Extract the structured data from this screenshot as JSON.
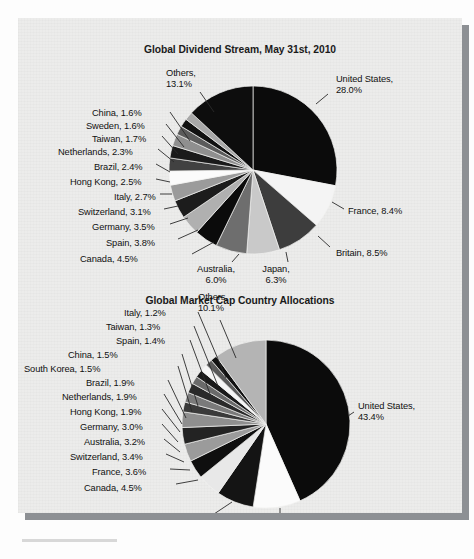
{
  "document": {
    "page_background": "#ececeb",
    "shadow_color": "#8d9094"
  },
  "chart_data": [
    {
      "type": "pie",
      "title": "Global Dividend Stream, May 31st, 2010",
      "xlabel": "",
      "ylabel": "",
      "legend_position": "callout-labels",
      "start_angle_deg": 0,
      "direction": "clockwise",
      "categories": [
        "United States",
        "France",
        "Britain",
        "Japan",
        "Australia",
        "Canada",
        "Spain",
        "Germany",
        "Switzerland",
        "Italy",
        "Hong Kong",
        "Brazil",
        "Netherlands",
        "Taiwan",
        "Sweden",
        "China",
        "Others"
      ],
      "values": [
        28.0,
        8.4,
        8.5,
        6.3,
        6.0,
        4.5,
        3.8,
        3.5,
        3.1,
        2.7,
        2.5,
        2.4,
        2.3,
        1.7,
        1.6,
        1.6,
        13.1
      ],
      "colors": [
        "#0b0b0b",
        "#f4f4f4",
        "#3d3d3d",
        "#c9c9c9",
        "#6e6e6e",
        "#0b0b0b",
        "#b0b0b0",
        "#1c1c1c",
        "#9b9b9b",
        "#fbfbfb",
        "#414141",
        "#1a1a1a",
        "#8f8f8f",
        "#5b5b5b",
        "#111111",
        "#a8a8a8",
        "#0d0d0d"
      ],
      "labels": [
        {
          "name": "United States",
          "value": "28.0%",
          "text_line1": "United States,",
          "text_line2": "28.0%"
        },
        {
          "name": "France",
          "value": "8.4%",
          "text_line1": "France, 8.4%",
          "text_line2": ""
        },
        {
          "name": "Britain",
          "value": "8.5%",
          "text_line1": "Britain, 8.5%",
          "text_line2": ""
        },
        {
          "name": "Japan",
          "value": "6.3%",
          "text_line1": "Japan,",
          "text_line2": "6.3%"
        },
        {
          "name": "Australia",
          "value": "6.0%",
          "text_line1": "Australia,",
          "text_line2": "6.0%"
        },
        {
          "name": "Canada",
          "value": "4.5%",
          "text_line1": "Canada, 4.5%",
          "text_line2": ""
        },
        {
          "name": "Spain",
          "value": "3.8%",
          "text_line1": "Spain, 3.8%",
          "text_line2": ""
        },
        {
          "name": "Germany",
          "value": "3.5%",
          "text_line1": "Germany, 3.5%",
          "text_line2": ""
        },
        {
          "name": "Switzerland",
          "value": "3.1%",
          "text_line1": "Switzerland, 3.1%",
          "text_line2": ""
        },
        {
          "name": "Italy",
          "value": "2.7%",
          "text_line1": "Italy, 2.7%",
          "text_line2": ""
        },
        {
          "name": "Hong Kong",
          "value": "2.5%",
          "text_line1": "Hong Kong, 2.5%",
          "text_line2": ""
        },
        {
          "name": "Brazil",
          "value": "2.4%",
          "text_line1": "Brazil, 2.4%",
          "text_line2": ""
        },
        {
          "name": "Netherlands",
          "value": "2.3%",
          "text_line1": "Netherlands, 2.3%",
          "text_line2": ""
        },
        {
          "name": "Taiwan",
          "value": "1.7%",
          "text_line1": "Taiwan, 1.7%",
          "text_line2": ""
        },
        {
          "name": "Sweden",
          "value": "1.6%",
          "text_line1": "Sweden, 1.6%",
          "text_line2": ""
        },
        {
          "name": "China",
          "value": "1.6%",
          "text_line1": "China, 1.6%",
          "text_line2": ""
        },
        {
          "name": "Others",
          "value": "13.1%",
          "text_line1": "Others,",
          "text_line2": "13.1%"
        }
      ]
    },
    {
      "type": "pie",
      "title": "Global Market Cap Country Allocations",
      "xlabel": "",
      "ylabel": "",
      "legend_position": "callout-labels",
      "start_angle_deg": 0,
      "direction": "clockwise",
      "categories": [
        "United States",
        "Japan",
        "Britain",
        "Canada",
        "France",
        "Switzerland",
        "Australia",
        "Germany",
        "Hong Kong",
        "Netherlands",
        "Brazil",
        "South Korea",
        "China",
        "Spain",
        "Taiwan",
        "Italy",
        "Others"
      ],
      "values": [
        43.4,
        9.1,
        7.2,
        4.5,
        3.6,
        3.4,
        3.2,
        3.0,
        1.9,
        1.9,
        1.9,
        1.5,
        1.5,
        1.4,
        1.3,
        1.2,
        10.1
      ],
      "colors": [
        "#0b0b0b",
        "#fbfbfb",
        "#141414",
        "#e8e8e8",
        "#0f0f0f",
        "#9b9b9b",
        "#232323",
        "#8f8f8f",
        "#3a3a3a",
        "#7a7a7a",
        "#2a2a2a",
        "#6a6a6a",
        "#1a1a1a",
        "#f6f6f6",
        "#5a5a5a",
        "#111111",
        "#b4b4b4"
      ],
      "labels": [
        {
          "name": "United States",
          "value": "43.4%",
          "text_line1": "United States,",
          "text_line2": "43.4%"
        },
        {
          "name": "Japan",
          "value": "9.1%",
          "text_line1": "Japan,",
          "text_line2": "9.1%"
        },
        {
          "name": "Britain",
          "value": "7.2%",
          "text_line1": "Britain,",
          "text_line2": "7.2%"
        },
        {
          "name": "Canada",
          "value": "4.5%",
          "text_line1": "Canada, 4.5%",
          "text_line2": ""
        },
        {
          "name": "France",
          "value": "3.6%",
          "text_line1": "France, 3.6%",
          "text_line2": ""
        },
        {
          "name": "Switzerland",
          "value": "3.4%",
          "text_line1": "Switzerland, 3.4%",
          "text_line2": ""
        },
        {
          "name": "Australia",
          "value": "3.2%",
          "text_line1": "Australia, 3.2%",
          "text_line2": ""
        },
        {
          "name": "Germany",
          "value": "3.0%",
          "text_line1": "Germany, 3.0%",
          "text_line2": ""
        },
        {
          "name": "Hong Kong",
          "value": "1.9%",
          "text_line1": "Hong Kong, 1.9%",
          "text_line2": ""
        },
        {
          "name": "Netherlands",
          "value": "1.9%",
          "text_line1": "Netherlands, 1.9%",
          "text_line2": ""
        },
        {
          "name": "Brazil",
          "value": "1.9%",
          "text_line1": "Brazil, 1.9%",
          "text_line2": ""
        },
        {
          "name": "South Korea",
          "value": "1.5%",
          "text_line1": "South Korea, 1.5%",
          "text_line2": ""
        },
        {
          "name": "China",
          "value": "1.5%",
          "text_line1": "China, 1.5%",
          "text_line2": ""
        },
        {
          "name": "Spain",
          "value": "1.4%",
          "text_line1": "Spain, 1.4%",
          "text_line2": ""
        },
        {
          "name": "Taiwan",
          "value": "1.3%",
          "text_line1": "Taiwan, 1.3%",
          "text_line2": ""
        },
        {
          "name": "Italy",
          "value": "1.2%",
          "text_line1": "Italy, 1.2%",
          "text_line2": ""
        },
        {
          "name": "Others",
          "value": "10.1%",
          "text_line1": "Others,",
          "text_line2": "10.1%"
        }
      ]
    }
  ],
  "charts_layout": [
    {
      "center_x": 235,
      "center_y": 144,
      "radius": 84,
      "labels_pos": [
        {
          "name": "United States",
          "x": 318,
          "y": 48,
          "align": "l",
          "anchor_x": 298,
          "anchor_y": 78,
          "lead_x": 310,
          "lead_y": 68
        },
        {
          "name": "France",
          "x": 330,
          "y": 180,
          "align": "l",
          "anchor_x": 314,
          "anchor_y": 176,
          "lead_x": 326,
          "lead_y": 183
        },
        {
          "name": "Britain",
          "x": 318,
          "y": 222,
          "align": "l",
          "anchor_x": 300,
          "anchor_y": 210,
          "lead_x": 312,
          "lead_y": 221
        },
        {
          "name": "Japan",
          "x": 258,
          "y": 238,
          "align": "c",
          "anchor_x": 268,
          "anchor_y": 226,
          "lead_x": 270,
          "lead_y": 236
        },
        {
          "name": "Australia",
          "x": 198,
          "y": 238,
          "align": "c",
          "anchor_x": 221,
          "anchor_y": 228,
          "lead_x": 214,
          "lead_y": 236
        },
        {
          "name": "Canada",
          "x": 62,
          "y": 228,
          "align": "l",
          "anchor_x": 196,
          "anchor_y": 216,
          "lead_x": 174,
          "lead_y": 228
        },
        {
          "name": "Spain",
          "x": 88,
          "y": 212,
          "align": "l",
          "anchor_x": 180,
          "anchor_y": 204,
          "lead_x": 160,
          "lead_y": 213
        },
        {
          "name": "Germany",
          "x": 74,
          "y": 196,
          "align": "l",
          "anchor_x": 170,
          "anchor_y": 192,
          "lead_x": 152,
          "lead_y": 198
        },
        {
          "name": "Switzerland",
          "x": 60,
          "y": 181,
          "align": "l",
          "anchor_x": 160,
          "anchor_y": 180,
          "lead_x": 146,
          "lead_y": 183
        },
        {
          "name": "Italy",
          "x": 96,
          "y": 166,
          "align": "l",
          "anchor_x": 154,
          "anchor_y": 168,
          "lead_x": 142,
          "lead_y": 168
        },
        {
          "name": "Hong Kong",
          "x": 52,
          "y": 151,
          "align": "l",
          "anchor_x": 152,
          "anchor_y": 156,
          "lead_x": 138,
          "lead_y": 153
        },
        {
          "name": "Brazil",
          "x": 76,
          "y": 136,
          "align": "l",
          "anchor_x": 152,
          "anchor_y": 146,
          "lead_x": 138,
          "lead_y": 138
        },
        {
          "name": "Netherlands",
          "x": 40,
          "y": 121,
          "align": "l",
          "anchor_x": 156,
          "anchor_y": 136,
          "lead_x": 140,
          "lead_y": 123
        },
        {
          "name": "Taiwan",
          "x": 74,
          "y": 108,
          "align": "l",
          "anchor_x": 160,
          "anchor_y": 128,
          "lead_x": 144,
          "lead_y": 110
        },
        {
          "name": "Sweden",
          "x": 68,
          "y": 95,
          "align": "l",
          "anchor_x": 166,
          "anchor_y": 121,
          "lead_x": 148,
          "lead_y": 98
        },
        {
          "name": "China",
          "x": 74,
          "y": 82,
          "align": "l",
          "anchor_x": 172,
          "anchor_y": 115,
          "lead_x": 152,
          "lead_y": 86
        },
        {
          "name": "Others",
          "x": 148,
          "y": 42,
          "align": "l",
          "anchor_x": 196,
          "anchor_y": 86,
          "lead_x": 182,
          "lead_y": 66
        }
      ]
    },
    {
      "center_x": 248,
      "center_y": 148,
      "radius": 84,
      "labels_pos": [
        {
          "name": "United States",
          "x": 340,
          "y": 125,
          "align": "l",
          "anchor_x": 330,
          "anchor_y": 140,
          "lead_x": 336,
          "lead_y": 136
        },
        {
          "name": "Japan",
          "x": 250,
          "y": 240,
          "align": "c",
          "anchor_x": 262,
          "anchor_y": 232,
          "lead_x": 262,
          "lead_y": 238
        },
        {
          "name": "Britain",
          "x": 178,
          "y": 240,
          "align": "c",
          "anchor_x": 214,
          "anchor_y": 226,
          "lead_x": 196,
          "lead_y": 238
        },
        {
          "name": "Canada",
          "x": 66,
          "y": 207,
          "align": "l",
          "anchor_x": 180,
          "anchor_y": 204,
          "lead_x": 158,
          "lead_y": 208
        },
        {
          "name": "France",
          "x": 74,
          "y": 191,
          "align": "l",
          "anchor_x": 172,
          "anchor_y": 194,
          "lead_x": 152,
          "lead_y": 193
        },
        {
          "name": "Switzerland",
          "x": 52,
          "y": 176,
          "align": "l",
          "anchor_x": 166,
          "anchor_y": 186,
          "lead_x": 148,
          "lead_y": 178
        },
        {
          "name": "Australia",
          "x": 66,
          "y": 161,
          "align": "l",
          "anchor_x": 162,
          "anchor_y": 176,
          "lead_x": 146,
          "lead_y": 163
        },
        {
          "name": "Germany",
          "x": 62,
          "y": 146,
          "align": "l",
          "anchor_x": 160,
          "anchor_y": 166,
          "lead_x": 144,
          "lead_y": 148
        },
        {
          "name": "Hong Kong",
          "x": 52,
          "y": 131,
          "align": "l",
          "anchor_x": 162,
          "anchor_y": 156,
          "lead_x": 144,
          "lead_y": 133
        },
        {
          "name": "Netherlands",
          "x": 44,
          "y": 116,
          "align": "l",
          "anchor_x": 164,
          "anchor_y": 148,
          "lead_x": 146,
          "lead_y": 118
        },
        {
          "name": "Brazil",
          "x": 68,
          "y": 102,
          "align": "l",
          "anchor_x": 168,
          "anchor_y": 142,
          "lead_x": 150,
          "lead_y": 104
        },
        {
          "name": "South Korea",
          "x": 6,
          "y": 88,
          "align": "l",
          "anchor_x": 174,
          "anchor_y": 136,
          "lead_x": 160,
          "lead_y": 90
        },
        {
          "name": "China",
          "x": 50,
          "y": 74,
          "align": "l",
          "anchor_x": 180,
          "anchor_y": 130,
          "lead_x": 164,
          "lead_y": 78
        },
        {
          "name": "Spain",
          "x": 98,
          "y": 60,
          "align": "l",
          "anchor_x": 192,
          "anchor_y": 118,
          "lead_x": 172,
          "lead_y": 64
        },
        {
          "name": "Taiwan",
          "x": 88,
          "y": 46,
          "align": "l",
          "anchor_x": 200,
          "anchor_y": 110,
          "lead_x": 176,
          "lead_y": 50
        },
        {
          "name": "Italy",
          "x": 106,
          "y": 32,
          "align": "l",
          "anchor_x": 208,
          "anchor_y": 102,
          "lead_x": 180,
          "lead_y": 36
        },
        {
          "name": "Others",
          "x": 180,
          "y": 16,
          "align": "l",
          "anchor_x": 218,
          "anchor_y": 82,
          "lead_x": 202,
          "lead_y": 44
        }
      ]
    }
  ]
}
